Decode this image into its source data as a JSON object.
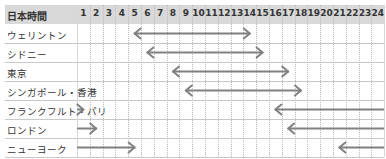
{
  "header": {
    "label": "日本時間",
    "hours": [
      "1",
      "2",
      "3",
      "4",
      "5",
      "6",
      "7",
      "8",
      "9",
      "10",
      "11",
      "12",
      "13",
      "14",
      "15",
      "16",
      "17",
      "18",
      "19",
      "20",
      "21",
      "22",
      "23",
      "24"
    ]
  },
  "rows": [
    {
      "label": "ウェリントン"
    },
    {
      "label": "シドニー"
    },
    {
      "label": "東京"
    },
    {
      "label": "シンガポール・香港"
    },
    {
      "label": "フランクフルト・パリ"
    },
    {
      "label": "ロンドン"
    },
    {
      "label": "ニューヨーク"
    }
  ],
  "colors": {
    "header_bg": "#d9d9d9",
    "arrow": "#808080",
    "grid": "#d6d6d6"
  },
  "chart_data": {
    "type": "table",
    "title": "",
    "xlabel": "日本時間",
    "x": [
      1,
      2,
      3,
      4,
      5,
      6,
      7,
      8,
      9,
      10,
      11,
      12,
      13,
      14,
      15,
      16,
      17,
      18,
      19,
      20,
      21,
      22,
      23,
      24
    ],
    "series": [
      {
        "name": "ウェリントン",
        "segments": [
          {
            "start": 5,
            "end": 14
          }
        ]
      },
      {
        "name": "シドニー",
        "segments": [
          {
            "start": 6,
            "end": 15
          }
        ]
      },
      {
        "name": "東京",
        "segments": [
          {
            "start": 8,
            "end": 17
          }
        ]
      },
      {
        "name": "シンガポール・香港",
        "segments": [
          {
            "start": 9,
            "end": 18
          }
        ]
      },
      {
        "name": "フランクフルト・パリ",
        "segments": [
          {
            "start": 0,
            "end": 1,
            "head": "right"
          },
          {
            "start": 16,
            "end": 24,
            "head": "left"
          }
        ]
      },
      {
        "name": "ロンドン",
        "segments": [
          {
            "start": 0,
            "end": 2,
            "head": "right"
          },
          {
            "start": 17,
            "end": 24,
            "head": "left"
          }
        ]
      },
      {
        "name": "ニューヨーク",
        "segments": [
          {
            "start": 0,
            "end": 5,
            "head": "right"
          },
          {
            "start": 21,
            "end": 24,
            "head": "left"
          }
        ]
      }
    ]
  }
}
